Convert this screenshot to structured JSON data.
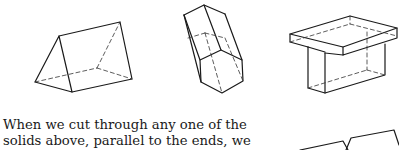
{
  "figures": [
    {
      "name": "triangular-prism",
      "label": "Triangular prism"
    },
    {
      "name": "hexagonal-prism",
      "label": "Hexagonal prism"
    },
    {
      "name": "t-shaped-prism",
      "label": "T-shaped prism"
    },
    {
      "name": "partial-solid",
      "label": "Partial solid (cut off)"
    }
  ],
  "caption": {
    "lines": [
      "When we cut through any one of the",
      "solids above, parallel to the ends, we"
    ]
  },
  "colors": {
    "ink": "#1a1a1a",
    "background": "#ffffff"
  }
}
